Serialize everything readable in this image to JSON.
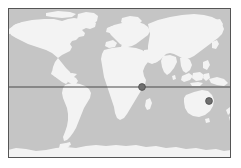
{
  "figure": {
    "type": "map",
    "width": 241,
    "height": 168,
    "background_color": "#ffffff"
  },
  "map": {
    "name": "world-map",
    "projection": "equirectangular",
    "panel": {
      "x": 8,
      "y": 8,
      "width": 223,
      "height": 150,
      "ocean_color": "#c5c5c5",
      "land_color": "#f3f3f3",
      "border_color": "#555555",
      "border_width": 1
    },
    "graticule": {
      "equator": {
        "label": "equator",
        "latitude": 0,
        "y": 87,
        "color": "#4a4a4a",
        "width": 1.2,
        "visible": true
      },
      "meridians_visible": false,
      "parallels_visible": false
    },
    "markers": [
      {
        "name": "marker-indian-ocean",
        "label": "Point 1",
        "x": 142,
        "y": 87,
        "radius": 3.4,
        "color": "#6f6f6f",
        "edge_color": "#4d4d4d",
        "region": "Horn of Africa / Indian Ocean"
      },
      {
        "name": "marker-eastern-australia",
        "label": "Point 2",
        "x": 209,
        "y": 101,
        "radius": 3.4,
        "color": "#6f6f6f",
        "edge_color": "#4d4d4d",
        "region": "Eastern Australia"
      }
    ]
  },
  "chart_data": {
    "type": "scatter",
    "title": "",
    "xlabel": "",
    "ylabel": "",
    "xlim": [
      -180,
      180
    ],
    "ylim": [
      -90,
      90
    ],
    "grid": false,
    "legend": null,
    "series": [
      {
        "name": "locations",
        "points": [
          {
            "label": "Point 1",
            "lon": 36,
            "lat": 1
          },
          {
            "label": "Point 2",
            "lon": 145,
            "lat": -17
          }
        ]
      }
    ],
    "annotations": [
      {
        "name": "equator-line",
        "type": "hline",
        "y": 0
      }
    ]
  }
}
